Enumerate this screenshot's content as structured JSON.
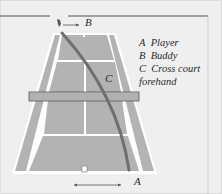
{
  "diagram": {
    "labels": {
      "player": "A",
      "buddy": "B",
      "shot": "C"
    },
    "legend": [
      {
        "key": "A",
        "text": "Player"
      },
      {
        "key": "B",
        "text": "Buddy"
      },
      {
        "key": "C",
        "text": "Cross court"
      },
      {
        "key": "",
        "text": "forehand"
      }
    ],
    "colors": {
      "background": "#efefef",
      "court": "#b3b3b3",
      "lines": "#ffffff",
      "ball_path": "#6f6f6f",
      "net": "#7a7a7a",
      "border": "#555555"
    }
  }
}
